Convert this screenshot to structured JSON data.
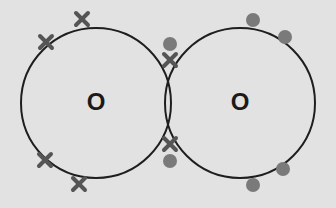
{
  "diagram": {
    "type": "dot-and-cross",
    "atoms": [
      {
        "symbol": "O",
        "cx": 96,
        "cy": 103,
        "r": 75,
        "electron_marker": "cross"
      },
      {
        "symbol": "O",
        "cx": 240,
        "cy": 103,
        "r": 75,
        "electron_marker": "dot"
      }
    ],
    "colors": {
      "background": "#e2e2e2",
      "circle": "#1e1e1e",
      "cross": "#555555",
      "dot": "#7a7a7a",
      "label": "#1a1a1a"
    },
    "crosses": [
      [
        46,
        42
      ],
      [
        82,
        19
      ],
      [
        45,
        160
      ],
      [
        79,
        184
      ],
      [
        170,
        60
      ],
      [
        170,
        144
      ]
    ],
    "dots": [
      [
        170,
        44
      ],
      [
        170,
        161
      ],
      [
        253,
        20
      ],
      [
        285,
        37
      ],
      [
        253,
        185
      ],
      [
        283,
        169
      ]
    ]
  }
}
